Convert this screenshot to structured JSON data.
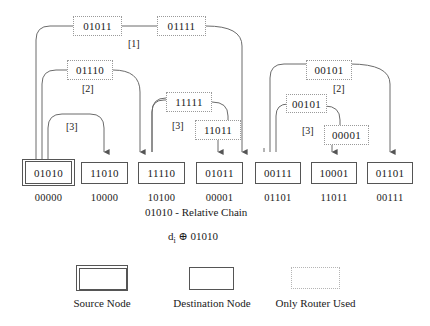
{
  "diagram": {
    "title_formula": "d",
    "formula_sub": "i",
    "formula_rest": " ⊕ 01010",
    "relative_chain_label": "01010 - Relative Chain",
    "routers": [
      {
        "id": "r-01011-top",
        "label": "01011"
      },
      {
        "id": "r-01111-top",
        "label": "01111"
      },
      {
        "id": "r-01110",
        "label": "01110"
      },
      {
        "id": "r-11111",
        "label": "11111"
      },
      {
        "id": "r-11011",
        "label": "11011"
      },
      {
        "id": "r-00101-top",
        "label": "00101"
      },
      {
        "id": "r-00101-mid",
        "label": "00101"
      },
      {
        "id": "r-00001",
        "label": "00001"
      }
    ],
    "hop_labels": [
      {
        "id": "hop-1-left",
        "label": "[1]"
      },
      {
        "id": "hop-2-left",
        "label": "[2]"
      },
      {
        "id": "hop-3-left",
        "label": "[3]"
      },
      {
        "id": "hop-3-mid",
        "label": "[3]"
      },
      {
        "id": "hop-2-right",
        "label": "[2]"
      },
      {
        "id": "hop-3-right",
        "label": "[3]"
      }
    ],
    "bottom_nodes": [
      {
        "id": "n-01010",
        "label": "01010",
        "relative": "00000",
        "type": "source"
      },
      {
        "id": "n-11010",
        "label": "11010",
        "relative": "10000",
        "type": "destination"
      },
      {
        "id": "n-11110",
        "label": "11110",
        "relative": "10100",
        "type": "destination"
      },
      {
        "id": "n-01011",
        "label": "01011",
        "relative": "00001",
        "type": "destination"
      },
      {
        "id": "n-00111",
        "label": "00111",
        "relative": "01101",
        "type": "destination"
      },
      {
        "id": "n-10001",
        "label": "10001",
        "relative": "11011",
        "type": "destination"
      },
      {
        "id": "n-01101",
        "label": "01101",
        "relative": "00111",
        "type": "destination"
      }
    ],
    "legend": [
      {
        "id": "legend-source",
        "label": "Source Node"
      },
      {
        "id": "legend-destination",
        "label": "Destination Node"
      },
      {
        "id": "legend-router",
        "label": "Only Router Used"
      }
    ]
  },
  "colors": {
    "line": "#6b6b6b",
    "solid_border": "#555555",
    "dotted_border": "#9a9a9a",
    "text": "#1a1a1a",
    "background": "#ffffff"
  }
}
